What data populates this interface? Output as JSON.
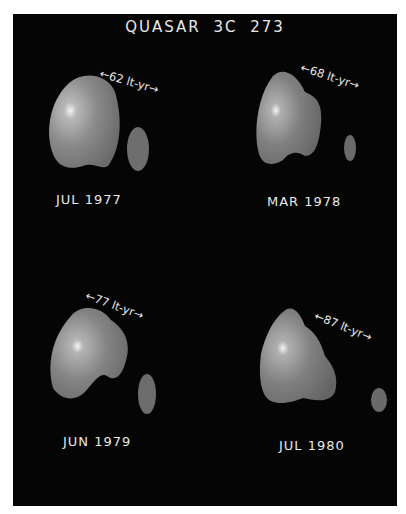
{
  "title": "QUASAR 3C 273",
  "frames": [
    {
      "date": "JUL 1977",
      "scale_label": "62 lt-yr",
      "separation_lt_yr": 62
    },
    {
      "date": "MAR 1978",
      "scale_label": "68 lt-yr",
      "separation_lt_yr": 68
    },
    {
      "date": "JUN 1979",
      "scale_label": "77 lt-yr",
      "separation_lt_yr": 77
    },
    {
      "date": "JUL 1980",
      "scale_label": "87 lt-yr",
      "separation_lt_yr": 87
    }
  ],
  "colors": {
    "background": "#050505",
    "text": "#e8e8e8",
    "margin": "#ffffff"
  }
}
